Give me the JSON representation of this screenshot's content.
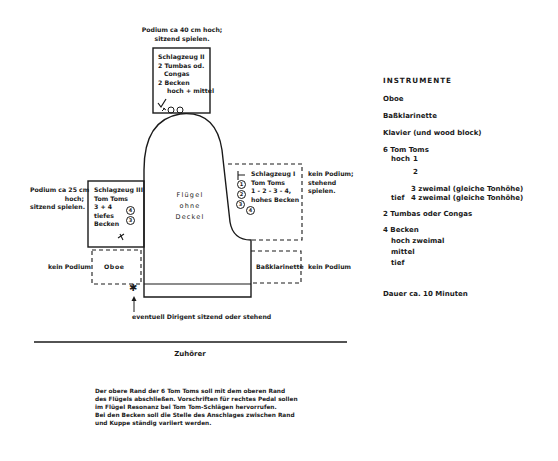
{
  "diagram": {
    "percussion_2": {
      "podium_note": [
        "Podium ca 40 cm hoch;",
        "sitzend spielen."
      ],
      "lines": [
        "Schlagzeug II",
        "2 Tumbas od.",
        "Congas",
        "2 Becken",
        "hoch + mittel"
      ]
    },
    "percussion_3": {
      "podium_note": [
        "Podium ca 25 cm",
        "hoch;",
        "sitzend  spielen."
      ],
      "lines": [
        "Schlagzeug III",
        "Tom Toms",
        "3 + 4",
        "tiefes",
        "Becken"
      ],
      "drum_numbers": [
        "4",
        "3"
      ]
    },
    "percussion_1": {
      "podium_note": [
        "kein Podium;",
        "stehend",
        "spielen."
      ],
      "lines": [
        "Schlagzeug I",
        "Tom Toms",
        "1 - 2 - 3 - 4,",
        "hohes Becken"
      ],
      "drum_numbers": [
        "1",
        "2",
        "3",
        "4"
      ]
    },
    "piano": {
      "lines": [
        "Flügel",
        "ohne",
        "Deckel"
      ]
    },
    "oboe": {
      "label": "Oboe",
      "podium_note": "kein Podium"
    },
    "bass_clarinet": {
      "label": "Baßklarinette",
      "podium_note": "kein Podium"
    },
    "conductor": {
      "symbol": "✱",
      "note": "eventuell Dirigent sitzend oder stehend"
    },
    "audience": {
      "label": "Zuhörer"
    },
    "footnote": [
      "Der obere Rand der 6 Tom Toms soll mit dem oberen Rand",
      "des Flügels abschließen. Vorschriften für rechtes Pedal sollen",
      "im Flügel Resonanz bei Tom Tom-Schlägen hervorrufen.",
      "Bei den Becken soll die Stelle des Anschlages zwischen Rand",
      "und Kuppe ständig variiert werden."
    ]
  },
  "instruments": {
    "title": "INSTRUMENTE",
    "items": [
      "Oboe",
      "Baßklarinette",
      "Klavier (und wood block)"
    ],
    "tomtoms": {
      "heading": "6 Tom Toms",
      "rows": [
        [
          "hoch",
          "1",
          ""
        ],
        [
          "",
          "2",
          ""
        ],
        [
          "",
          "3",
          "zweimal (gleiche Tonhöhe)"
        ],
        [
          "tief",
          "4",
          "zweimal (gleiche Tonhöhe)"
        ]
      ]
    },
    "tumbas": "2 Tumbas oder Congas",
    "cymbals": {
      "heading": "4 Becken",
      "rows": [
        "hoch zweimal",
        "mittel",
        "tief"
      ]
    },
    "duration": "Dauer ca. 10 Minuten"
  }
}
